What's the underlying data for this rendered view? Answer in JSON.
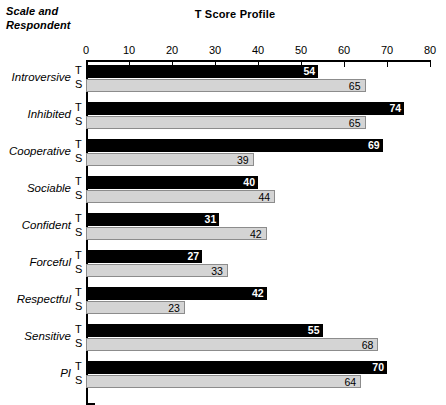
{
  "header": {
    "corner_label_line1": "Scale and",
    "corner_label_line2": "Respondent",
    "title": "T Score Profile"
  },
  "axis": {
    "ticks": [
      "0",
      "10",
      "20",
      "30",
      "40",
      "50",
      "60",
      "70",
      "80"
    ]
  },
  "series_keys": {
    "t": "T",
    "s": "S"
  },
  "colors": {
    "bar_t": "#000000",
    "bar_s": "#d4d4d4",
    "bar_s_border": "#8c8c8c",
    "axis": "#000000",
    "background": "#ffffff"
  },
  "chart_data": {
    "type": "bar",
    "orientation": "horizontal",
    "title": "T Score Profile",
    "xlabel": "",
    "ylabel": "Scale and Respondent",
    "xlim": [
      0,
      80
    ],
    "xticks": [
      0,
      10,
      20,
      30,
      40,
      50,
      60,
      70,
      80
    ],
    "grid": false,
    "legend": "none",
    "categories": [
      "Introversive",
      "Inhibited",
      "Cooperative",
      "Sociable",
      "Confident",
      "Forceful",
      "Respectful",
      "Sensitive",
      "PI"
    ],
    "series": [
      {
        "name": "T",
        "values": [
          54,
          74,
          69,
          40,
          31,
          27,
          42,
          55,
          70
        ]
      },
      {
        "name": "S",
        "values": [
          65,
          65,
          39,
          44,
          42,
          33,
          23,
          68,
          64
        ]
      }
    ]
  }
}
